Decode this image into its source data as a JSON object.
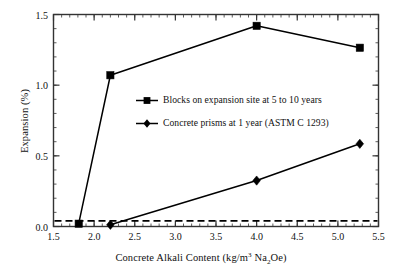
{
  "chart_data": {
    "type": "line",
    "title": "",
    "xlabel": "Concrete Alkali Content (kg/m3 Na2Oe)",
    "xlabel_parts": {
      "pre": "Concrete Alkali Content (kg/m",
      "sup": "3",
      "mid": " Na",
      "sub": "2",
      "post": "Oe)"
    },
    "ylabel": "Expansion (%)",
    "xlim": [
      1.5,
      5.5
    ],
    "ylim": [
      0.0,
      1.5
    ],
    "xticks": [
      1.5,
      2.0,
      2.5,
      3.0,
      3.5,
      4.0,
      4.5,
      5.0,
      5.5
    ],
    "xtick_labels": [
      "1.5",
      "2.0",
      "2.5",
      "3.0",
      "3.5",
      "4.0",
      "4.5",
      "5.0",
      "5.5"
    ],
    "yticks": [
      0.0,
      0.5,
      1.0,
      1.5
    ],
    "ytick_labels": [
      "0.0",
      "0.5",
      "1.0",
      "1.5"
    ],
    "x_minor_step": 0.1,
    "y_minor_step": 0.1,
    "grid": false,
    "legend_position": "center",
    "series": [
      {
        "name": "Blocks on expansion site at 5 to 10 years",
        "marker": "square",
        "color": "#000000",
        "points": [
          {
            "x": 1.81,
            "y": 0.02
          },
          {
            "x": 2.2,
            "y": 1.07
          },
          {
            "x": 4.0,
            "y": 1.42
          },
          {
            "x": 5.27,
            "y": 1.265
          }
        ]
      },
      {
        "name": "Concrete prisms at 1 year (ASTM C 1293)",
        "marker": "diamond",
        "color": "#000000",
        "points": [
          {
            "x": 2.2,
            "y": 0.012
          },
          {
            "x": 4.0,
            "y": 0.325
          },
          {
            "x": 5.27,
            "y": 0.585
          }
        ]
      }
    ],
    "reference_lines": [
      {
        "name": "expansion-threshold",
        "orientation": "horizontal",
        "value": 0.04,
        "style": "dashed",
        "color": "#000000"
      }
    ]
  },
  "legend": {
    "entries": [
      {
        "label": "Blocks on expansion site at 5 to 10 years",
        "marker": "square"
      },
      {
        "label": "Concrete prisms at 1 year (ASTM C 1293)",
        "marker": "diamond"
      }
    ]
  },
  "axes": {
    "y_title": "Expansion (%)"
  },
  "colors": {
    "line": "#000000",
    "axis": "#333333",
    "background": "#ffffff"
  }
}
